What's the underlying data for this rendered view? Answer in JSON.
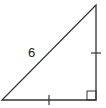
{
  "diagram": {
    "type": "right-isosceles-triangle",
    "stroke_color": "#333333",
    "vertices": {
      "left": [
        2,
        100
      ],
      "right_angle": [
        96,
        100
      ],
      "top": [
        96,
        5
      ]
    },
    "hypotenuse_label": "6",
    "congruent_legs": [
      "bottom",
      "right"
    ],
    "right_angle_marker": true
  }
}
